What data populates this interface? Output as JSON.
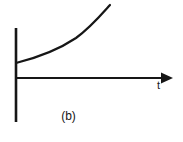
{
  "figure": {
    "caption": "(b)",
    "background_color": "#ffffff",
    "ink_color": "#161616",
    "axes": {
      "horizontal": {
        "label": "t",
        "name": "time-axis",
        "has_arrowhead": true,
        "x_start": 16,
        "x_end": 162,
        "y": 78
      },
      "vertical": {
        "label": "",
        "name": "value-axis",
        "has_arrowhead": false,
        "x": 16,
        "y_start": 28,
        "y_end": 122
      }
    },
    "icons": {
      "arrow": "arrow-right-icon"
    }
  },
  "chart_data": {
    "type": "line",
    "title": "(b)",
    "xlabel": "t",
    "ylabel": "",
    "grid": false,
    "legend": null,
    "xlim": [
      0,
      146
    ],
    "ylim": [
      -12,
      82
    ],
    "series": [
      {
        "name": "rising-exponential-curve",
        "x": [
          0,
          10,
          20,
          30,
          40,
          50,
          60,
          70,
          80,
          94
        ],
        "y": [
          15,
          17,
          20,
          23,
          27,
          32,
          38,
          46,
          58,
          73
        ],
        "path": "M 16 63 C 36 58, 58 50, 76 38 C 90 28, 101 15, 110 5"
      }
    ],
    "annotations": [
      {
        "text": "t",
        "x": 161,
        "y": 86
      },
      {
        "text": "(b)",
        "x": 68,
        "y": 118
      }
    ]
  }
}
